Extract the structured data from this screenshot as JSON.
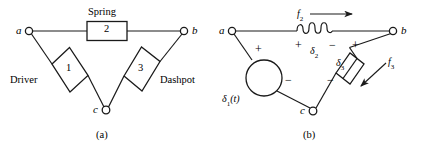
{
  "figure": {
    "stroke_color": "#1a1a1a",
    "background": "#ffffff"
  },
  "panel_a": {
    "caption": "(a)",
    "nodes": [
      {
        "id": "a",
        "label": "a"
      },
      {
        "id": "b",
        "label": "b"
      },
      {
        "id": "c",
        "label": "c"
      }
    ],
    "elements": [
      {
        "name": "spring",
        "title": "Spring",
        "number": "2"
      },
      {
        "name": "driver",
        "title": "Driver",
        "number": "1"
      },
      {
        "name": "dashpot",
        "title": "Dashpot",
        "number": "3"
      }
    ]
  },
  "panel_b": {
    "caption": "(b)",
    "nodes": [
      {
        "id": "a",
        "label": "a"
      },
      {
        "id": "b",
        "label": "b"
      },
      {
        "id": "c",
        "label": "c"
      }
    ],
    "source": {
      "name": "driver-source",
      "label": "δ",
      "sub": "1",
      "arg": "(t)",
      "plus": "+",
      "minus": "−"
    },
    "spring": {
      "name": "spring-coil",
      "label": "δ",
      "sub": "2",
      "plus": "+",
      "minus": "−",
      "force": "f",
      "force_sub": "2"
    },
    "dashpot": {
      "name": "dashpot-element",
      "label": "δ",
      "sub": "3",
      "plus": "+",
      "minus": "−",
      "force": "f",
      "force_sub": "3"
    }
  }
}
